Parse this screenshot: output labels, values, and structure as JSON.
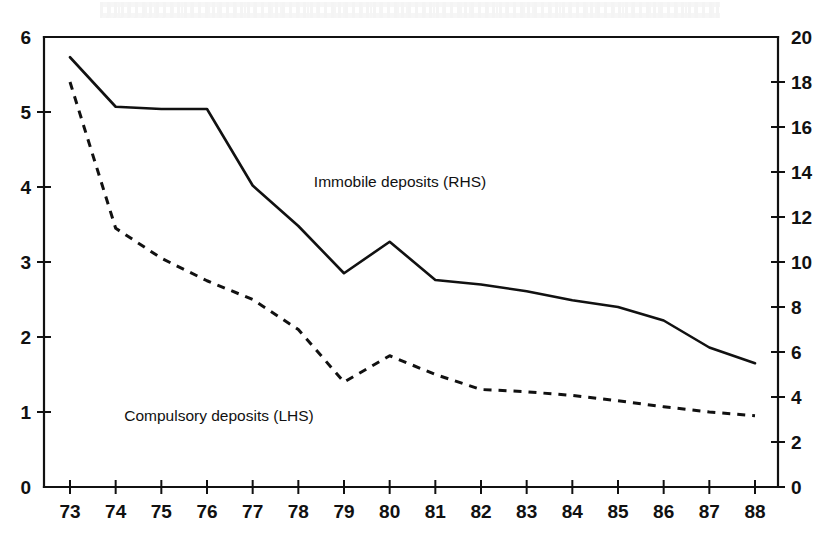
{
  "chart_data": {
    "type": "line",
    "title": "",
    "subtitle": "",
    "xlabel": "",
    "ylabel": "",
    "grid": false,
    "legend_position": "inline-annotations",
    "x": [
      "73",
      "74",
      "75",
      "76",
      "77",
      "78",
      "79",
      "80",
      "81",
      "82",
      "83",
      "84",
      "85",
      "86",
      "87",
      "88"
    ],
    "xlim": [
      73,
      88
    ],
    "left_axis": {
      "label": "",
      "ylim": [
        0,
        6
      ],
      "ticks": [
        "0",
        "1",
        "2",
        "3",
        "4",
        "5",
        "6"
      ],
      "tick_values": [
        0,
        1,
        2,
        3,
        4,
        5,
        6
      ]
    },
    "right_axis": {
      "label": "",
      "ylim": [
        0,
        20
      ],
      "ticks": [
        "0",
        "2",
        "4",
        "6",
        "8",
        "10",
        "12",
        "14",
        "16",
        "18",
        "20"
      ],
      "tick_values": [
        0,
        2,
        4,
        6,
        8,
        10,
        12,
        14,
        16,
        18,
        20
      ]
    },
    "series": [
      {
        "name": "Immobile deposits (RHS)",
        "axis": "right",
        "style": "solid",
        "color": "#111111",
        "values": [
          19.1,
          16.9,
          16.8,
          16.8,
          13.4,
          11.6,
          9.5,
          10.9,
          9.2,
          9.0,
          8.7,
          8.3,
          8.0,
          7.4,
          6.2,
          5.5
        ]
      },
      {
        "name": "Compulsory deposits (LHS)",
        "axis": "left",
        "style": "dashed",
        "color": "#111111",
        "values": [
          5.4,
          3.45,
          3.05,
          2.75,
          2.5,
          2.1,
          1.4,
          1.75,
          1.5,
          1.3,
          1.27,
          1.22,
          1.15,
          1.07,
          1.0,
          0.95
        ]
      }
    ],
    "annotations": [
      {
        "text": "Immobile deposits (RHS)",
        "x_px": 400,
        "y_px": 187
      },
      {
        "text": "Compulsory deposits (LHS)",
        "x_px": 219,
        "y_px": 421
      }
    ]
  },
  "figure": {
    "background_color": "#ffffff",
    "ink_color": "#111111",
    "plot_left_px": 44,
    "plot_right_px": 778,
    "plot_top_px": 37,
    "plot_bottom_px": 487
  }
}
